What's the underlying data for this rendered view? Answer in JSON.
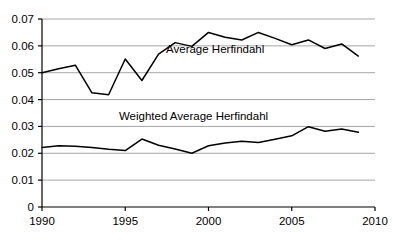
{
  "chart_data": {
    "type": "line",
    "title": "",
    "xlabel": "",
    "ylabel": "",
    "xlim": [
      1990,
      2010
    ],
    "ylim": [
      0,
      0.07
    ],
    "grid": true,
    "grid_axis": "y",
    "legend_position": "inline-annotation",
    "x_ticks": [
      "1990",
      "1995",
      "2000",
      "2005",
      "2010"
    ],
    "x_tick_values": [
      1990,
      1995,
      2000,
      2005,
      2010
    ],
    "y_ticks": [
      "0",
      "0.01",
      "0.02",
      "0.03",
      "0.04",
      "0.05",
      "0.06",
      "0.07"
    ],
    "y_tick_values": [
      0,
      0.01,
      0.02,
      0.03,
      0.04,
      0.05,
      0.06,
      0.07
    ],
    "x": [
      1990,
      1991,
      1992,
      1993,
      1994,
      1995,
      1996,
      1997,
      1998,
      1999,
      2000,
      2001,
      2002,
      2003,
      2004,
      2005,
      2006,
      2007,
      2008,
      2009
    ],
    "series": [
      {
        "name": "Average Herfindahl",
        "color": "#000000",
        "label_x": 2000.4,
        "label_y": 0.0572,
        "values": [
          0.05,
          0.0515,
          0.0528,
          0.0425,
          0.0418,
          0.0551,
          0.0471,
          0.0569,
          0.0612,
          0.0598,
          0.065,
          0.0632,
          0.0622,
          0.065,
          0.0628,
          0.0604,
          0.0622,
          0.059,
          0.0607,
          0.0562
        ]
      },
      {
        "name": "Weighted Average Herfindahl",
        "color": "#000000",
        "label_x": 1999.1,
        "label_y": 0.0325,
        "values": [
          0.0222,
          0.0228,
          0.0226,
          0.0222,
          0.0215,
          0.021,
          0.0253,
          0.023,
          0.0216,
          0.02,
          0.0228,
          0.0238,
          0.0245,
          0.024,
          0.0252,
          0.0265,
          0.0299,
          0.0282,
          0.029,
          0.0278
        ]
      }
    ],
    "annotations": [
      {
        "text": "Average Herfindahl",
        "x": 2000.4,
        "y": 0.0572
      },
      {
        "text": "Weighted Average Herfindahl",
        "x": 1999.1,
        "y": 0.0325
      }
    ],
    "axis_color": "#000000",
    "grid_color": "#a6a6a6",
    "background": "#ffffff"
  }
}
